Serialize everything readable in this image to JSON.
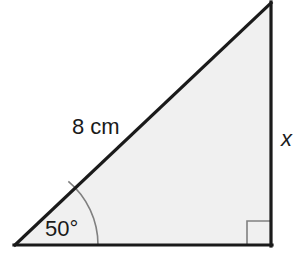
{
  "figure": {
    "kind": "right-triangle-diagram",
    "background_color": "#ffffff",
    "fill_color": "#f0f0f0",
    "edge_color": "#1a1a1a",
    "marker_color": "#808080",
    "edge_width": 3,
    "marker_width": 1.6,
    "vertices": {
      "left": [
        15,
        245
      ],
      "apex": [
        271,
        3
      ],
      "corner": [
        271,
        245
      ]
    },
    "labels": {
      "hypotenuse": "8 cm",
      "vertical_side": "x",
      "angle": "50°"
    },
    "angle_arc": {
      "vertex": [
        15,
        245
      ],
      "radius": 83,
      "degrees": 50
    },
    "right_angle_marker": {
      "corner": [
        271,
        245
      ],
      "size": 24
    }
  }
}
